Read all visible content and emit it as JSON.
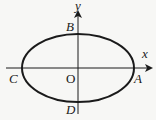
{
  "diagram": {
    "type": "ellipse-on-axes",
    "axes": {
      "x_label": "x",
      "y_label": "y",
      "origin_label": "O"
    },
    "points": {
      "A": "A",
      "B": "B",
      "C": "C",
      "D": "D"
    },
    "colors": {
      "background": "#f7f7f5",
      "stroke": "#1a1a1a"
    }
  }
}
